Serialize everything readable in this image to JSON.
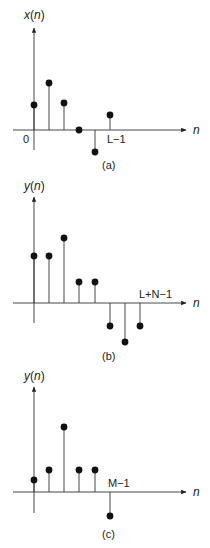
{
  "panels": [
    {
      "id": "a",
      "ylabel": "x(n)",
      "ylabel_fn": "x",
      "xlabel": "n",
      "caption": "(a)",
      "origin_label": "0",
      "end_label": "L−1",
      "end_index": 5,
      "values": [
        25,
        47,
        27,
        0,
        -22,
        15
      ]
    },
    {
      "id": "b",
      "ylabel": "y(n)",
      "ylabel_fn": "y",
      "xlabel": "n",
      "caption": "(b)",
      "end_label": "L+N−1",
      "end_index": 7,
      "values": [
        47,
        47,
        65,
        21,
        21,
        -23,
        -39,
        -23
      ]
    },
    {
      "id": "c",
      "ylabel": "y(n)",
      "ylabel_fn": "y",
      "xlabel": "n",
      "caption": "(c)",
      "end_label": "M−1",
      "end_index": 5,
      "values": [
        12,
        22,
        65,
        22,
        22,
        -24
      ]
    }
  ],
  "colors": {
    "stroke": "#222222",
    "dot": "#111111"
  }
}
